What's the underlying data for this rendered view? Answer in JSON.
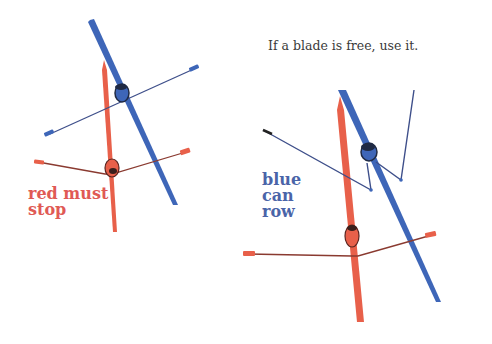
{
  "caption": "If a blade is free, use it.",
  "labels": {
    "red": [
      "red must",
      "stop"
    ],
    "blue": [
      "blue",
      "can",
      "row"
    ]
  },
  "colors": {
    "red_boat": "#E8604A",
    "blue_boat": "#3E66B8",
    "red_text": "#E05A55",
    "blue_text": "#4A64A8",
    "oar_shaft_red": "#8A3A30",
    "oar_shaft_blue": "#3E4F8A",
    "rower_dark": "#2a2a2a",
    "caption_text": "#3a3a3a"
  },
  "scenes": [
    {
      "name": "left-scene",
      "description": "blue boat rowing across red boat; red must stop"
    },
    {
      "name": "right-scene",
      "description": "blue boat with oars raised clear; blue can row"
    }
  ]
}
